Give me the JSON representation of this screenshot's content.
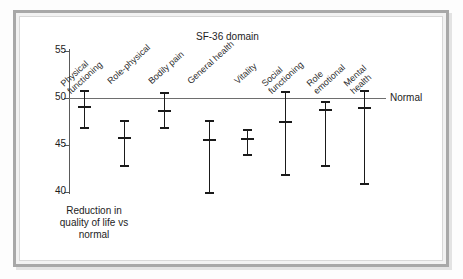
{
  "chart_data": {
    "type": "scatter",
    "title": "SF-36 domain",
    "xlabel": "SF-36 domain",
    "ylabel": "Reduction in quality of life vs normal",
    "ylim": [
      40,
      55
    ],
    "yticks": [
      "40",
      "45",
      "50",
      "55"
    ],
    "grid": false,
    "reference_line": {
      "value": 50,
      "label": "Normal"
    },
    "categories": [
      "Physical functioning",
      "Role-physical",
      "Bodily pain",
      "General health",
      "Vitality",
      "Social functioning",
      "Role emotional",
      "Mental health"
    ],
    "series": [
      {
        "name": "Mean with 95% confidence interval",
        "values": [
          49.1,
          45.9,
          48.7,
          45.6,
          45.7,
          47.6,
          48.8,
          49.0
        ],
        "lower": [
          46.9,
          42.9,
          46.9,
          40.0,
          44.0,
          41.9,
          42.9,
          41.0
        ],
        "upper": [
          50.8,
          47.7,
          50.6,
          47.7,
          46.7,
          50.7,
          49.7,
          50.8
        ]
      }
    ],
    "points": [
      {
        "category": "Physical functioning",
        "mean": 49.1,
        "lower": 46.9,
        "upper": 50.8
      },
      {
        "category": "Role-physical",
        "mean": 45.9,
        "lower": 42.9,
        "upper": 47.7
      },
      {
        "category": "Bodily pain",
        "mean": 48.7,
        "lower": 46.9,
        "upper": 50.6
      },
      {
        "category": "General health",
        "mean": 45.6,
        "lower": 40.0,
        "upper": 47.7
      },
      {
        "category": "Vitality",
        "mean": 45.7,
        "lower": 44.0,
        "upper": 46.7
      },
      {
        "category": "Social functioning",
        "mean": 47.6,
        "lower": 41.9,
        "upper": 50.7
      },
      {
        "category": "Role emotional",
        "mean": 48.8,
        "lower": 42.9,
        "upper": 49.7
      },
      {
        "category": "Mental health",
        "mean": 49.0,
        "lower": 41.0,
        "upper": 50.8
      }
    ]
  },
  "axis": {
    "ticks": [
      {
        "label": "55",
        "value": 55
      },
      {
        "label": "50",
        "value": 50
      },
      {
        "label": "45",
        "value": 45
      },
      {
        "label": "40",
        "value": 40
      }
    ]
  },
  "labels": {
    "title": "SF-36 domain",
    "normal": "Normal",
    "ylabel_line1": "Reduction in",
    "ylabel_line2": "quality of life vs",
    "ylabel_line3": "normal",
    "categories": [
      {
        "line1": "Physical",
        "line2": "functioning"
      },
      {
        "line1": "Role-physical",
        "line2": ""
      },
      {
        "line1": "Bodily pain",
        "line2": ""
      },
      {
        "line1": "General health",
        "line2": ""
      },
      {
        "line1": "Vitality",
        "line2": ""
      },
      {
        "line1": "Social",
        "line2": "functioning"
      },
      {
        "line1": "Role",
        "line2": "emotional"
      },
      {
        "line1": "Mental",
        "line2": "health"
      }
    ]
  },
  "colors": {
    "marker": "#1a1a1a",
    "axis": "#5a5a5a",
    "reference": "#6e6e6e",
    "frame": "#a8a8a8",
    "background": "#ffffff"
  }
}
